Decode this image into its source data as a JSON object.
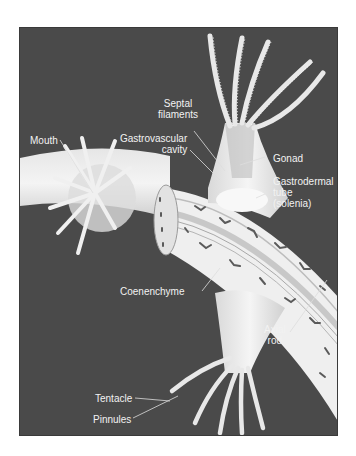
{
  "figure": {
    "background_color": "#4a4a4a",
    "labels": [
      {
        "id": "septal-filaments",
        "lines": [
          "Septal",
          "filaments"
        ]
      },
      {
        "id": "mouth",
        "lines": [
          "Mouth"
        ]
      },
      {
        "id": "gastrovascular-cavity",
        "lines": [
          "Gastrovascular",
          "cavity"
        ]
      },
      {
        "id": "gonad",
        "lines": [
          "Gonad"
        ]
      },
      {
        "id": "gastrodermal-tube",
        "lines": [
          "Gastrodermal",
          "tube",
          "(solenia)"
        ]
      },
      {
        "id": "coenenchyme",
        "lines": [
          "Coenenchyme"
        ]
      },
      {
        "id": "axial-rod",
        "lines": [
          "Axial",
          "rod"
        ]
      },
      {
        "id": "tentacle",
        "lines": [
          "Tentacle"
        ]
      },
      {
        "id": "pinnules",
        "lines": [
          "Pinnules"
        ]
      }
    ]
  }
}
